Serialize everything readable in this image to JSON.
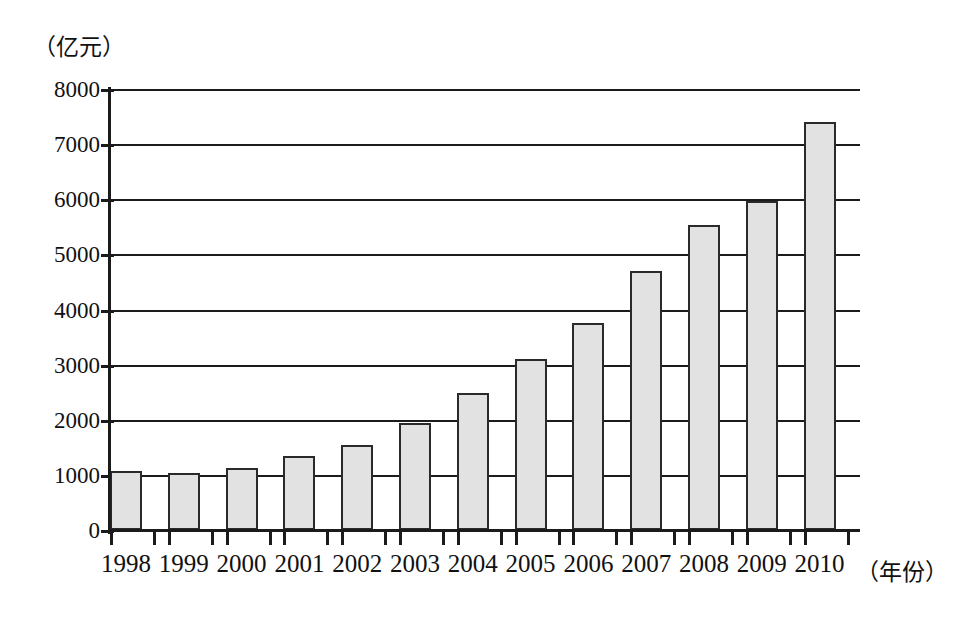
{
  "chart_data": {
    "type": "bar",
    "title": "",
    "subtitle": "",
    "xlabel": "（年份）",
    "ylabel": "（亿元）",
    "categories": [
      "1998",
      "1999",
      "2000",
      "2001",
      "2002",
      "2003",
      "2004",
      "2005",
      "2006",
      "2007",
      "2008",
      "2009",
      "2010"
    ],
    "values": [
      1070,
      1040,
      1130,
      1340,
      1550,
      1940,
      2490,
      3100,
      3750,
      4700,
      5540,
      5960,
      7400
    ],
    "series": [
      {
        "name": "",
        "values": [
          1070,
          1040,
          1130,
          1340,
          1550,
          1940,
          2490,
          3100,
          3750,
          4700,
          5540,
          5960,
          7400
        ]
      }
    ],
    "ylim": [
      0,
      8000
    ],
    "ytick_labels": [
      "0",
      "1000",
      "2000",
      "3000",
      "4000",
      "5000",
      "6000",
      "7000",
      "8000"
    ],
    "ytick_values": [
      0,
      1000,
      2000,
      3000,
      4000,
      5000,
      6000,
      7000,
      8000
    ],
    "grid": true,
    "grid_axis": "y",
    "legend": false,
    "legend_position": "none",
    "bar_fill_color": "#e2e2e2",
    "bar_border_color": "#2a2a2a",
    "axis_color": "#1b1b1b",
    "background_color": "#ffffff",
    "annotations": []
  },
  "axis": {
    "y_unit_caption": "（亿元）",
    "x_unit_caption": "（年份）"
  }
}
